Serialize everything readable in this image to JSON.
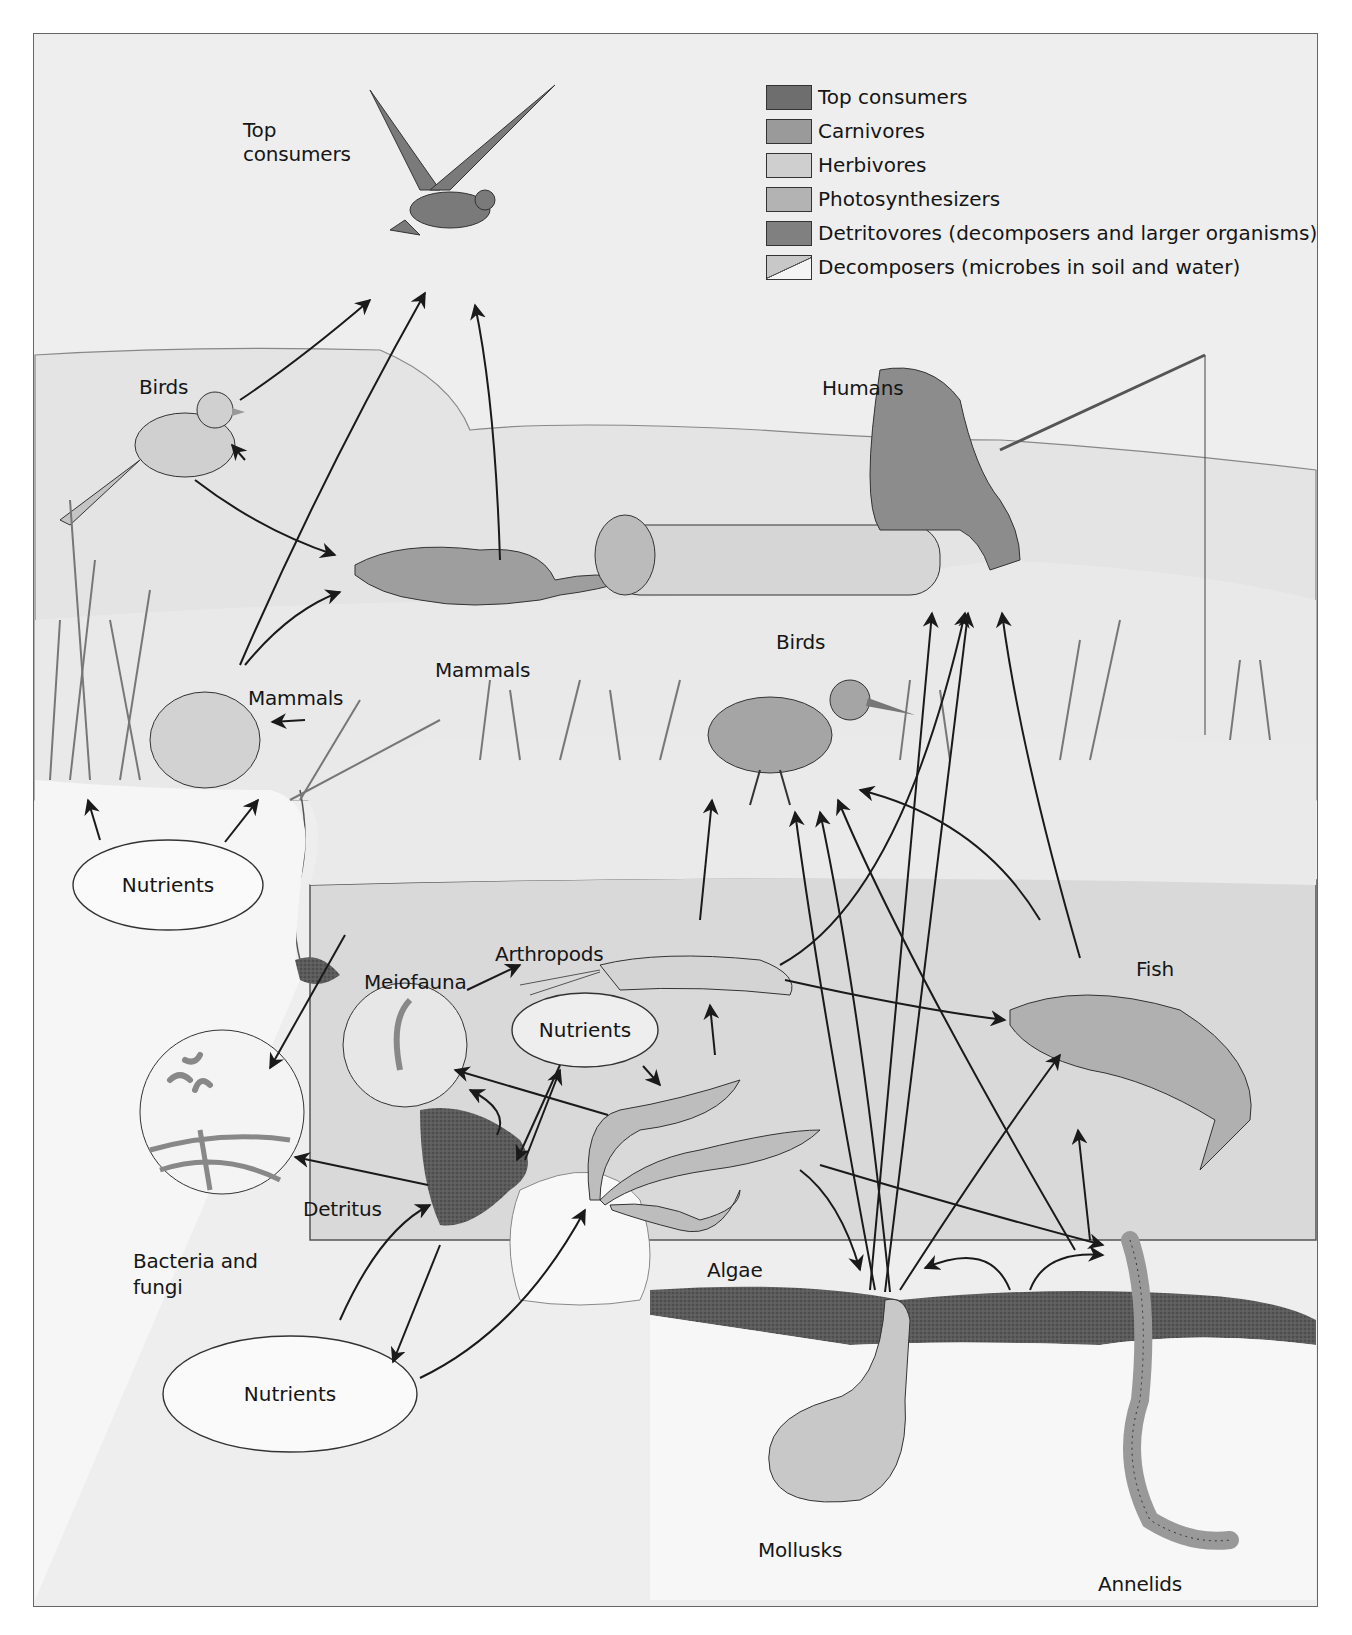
{
  "legend": {
    "items": [
      {
        "label": "Top consumers",
        "color": "#6e6e6e"
      },
      {
        "label": "Carnivores",
        "color": "#9a9a9a"
      },
      {
        "label": "Herbivores",
        "color": "#cfcfcf"
      },
      {
        "label": "Photosynthesizers",
        "color": "#b3b3b3"
      },
      {
        "label": "Detritovores (decomposers and larger organisms)",
        "color": "#808080"
      },
      {
        "label": "Decomposers (microbes in soil and water)",
        "color": "#d8d8d8"
      }
    ]
  },
  "labels": {
    "top_consumers_1": "Top",
    "top_consumers_2": "consumers",
    "birds_land": "Birds",
    "humans": "Humans",
    "mammals_weasel": "Mammals",
    "mammals_mouse": "Mammals",
    "birds_wading": "Birds",
    "nutrients_land": "Nutrients",
    "arthropods": "Arthropods",
    "meiofauna": "Meiofauna",
    "nutrients_water": "Nutrients",
    "fish": "Fish",
    "detritus": "Detritus",
    "bacteria_fungi_1": "Bacteria and",
    "bacteria_fungi_2": "fungi",
    "algae": "Algae",
    "nutrients_sediment": "Nutrients",
    "mollusks": "Mollusks",
    "annelids": "Annelids"
  },
  "colors": {
    "background": "#eeeeee",
    "land": "#e2e2e2",
    "water": "#dcdcdc",
    "sediment": "#5a5a5a",
    "line": "#1a1a1a"
  }
}
